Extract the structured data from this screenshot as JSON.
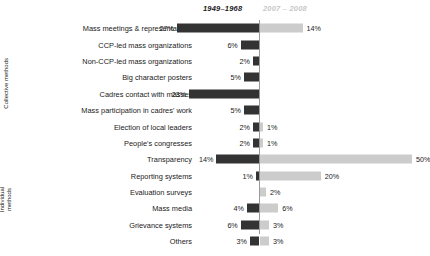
{
  "legend": {
    "past_label": "1949–1968",
    "recent_label": "2007 – 2008",
    "past_color": "#333333",
    "recent_color": "#cccccc"
  },
  "groups": [
    {
      "name": "collective",
      "label": "Collective methods",
      "rows": 7
    },
    {
      "name": "individual",
      "label": "Individual methods",
      "rows": 6
    }
  ],
  "chart_data": {
    "type": "bar",
    "orientation": "horizontal",
    "layout": "diverging",
    "title": "",
    "xlabel": "",
    "ylabel": "",
    "grid": false,
    "legend_position": "top",
    "axis_center_percent": 0,
    "xlim": [
      0,
      50
    ],
    "categories": [
      "Mass meetings & representatives",
      "CCP-led mass organizations",
      "Non-CCP-led mass organizations",
      "Big character posters",
      "Cadres  contact with masses",
      "Mass participation in cadres' work",
      "Election of local leaders",
      "People's congresses",
      "Transparency",
      "Reporting systems",
      "Evaluation surveys",
      "Mass media",
      "Grievance systems",
      "Others"
    ],
    "series": [
      {
        "name": "1949–1968",
        "side": "left",
        "color": "#333333",
        "values": [
          27,
          6,
          2,
          5,
          23,
          5,
          2,
          2,
          14,
          1,
          null,
          4,
          6,
          3
        ],
        "labels": [
          "27%",
          "6%",
          "2%",
          "5%",
          "23%",
          "5%",
          "2%",
          "2%",
          "14%",
          "1%",
          "",
          "4%",
          "6%",
          "3%"
        ]
      },
      {
        "name": "2007 – 2008",
        "side": "right",
        "color": "#cccccc",
        "values": [
          14,
          null,
          null,
          null,
          null,
          null,
          1,
          1,
          50,
          20,
          2,
          6,
          3,
          3
        ],
        "labels": [
          "14%",
          "",
          "",
          "",
          "",
          "",
          "1%",
          "1%",
          "50%",
          "20%",
          "2%",
          "6%",
          "3%",
          "3%"
        ]
      }
    ]
  }
}
